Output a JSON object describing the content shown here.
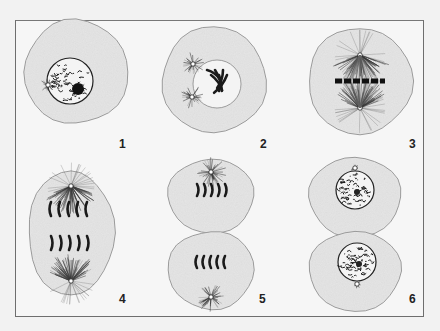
{
  "diagram": {
    "type": "mitosis-stages",
    "colors": {
      "background": "#f2f2f2",
      "frame": "#6e6e6e",
      "cytoplasm": "#e6e6e6",
      "cell_outline": "#9a9a9a",
      "chromatin": "#1a1a1a",
      "nucleus_fill": "#f4f4f4"
    },
    "stages": [
      {
        "label": "1",
        "label_pos": [
          122,
          146
        ],
        "kind": "interphase",
        "cells": [
          {
            "cx": 76,
            "cy": 72,
            "rx": 52,
            "ry": 52
          }
        ],
        "nucleus": {
          "cx": 70,
          "cy": 81,
          "r": 23
        }
      },
      {
        "label": "2",
        "label_pos": [
          258,
          146
        ],
        "kind": "prophase",
        "cells": [
          {
            "cx": 214,
            "cy": 80,
            "rx": 52,
            "ry": 53
          }
        ],
        "nucleus": {
          "cx": 217,
          "cy": 84,
          "r": 24
        }
      },
      {
        "label": "3",
        "label_pos": [
          411,
          146
        ],
        "kind": "metaphase",
        "cells": [
          {
            "cx": 360,
            "cy": 81,
            "rx": 52,
            "ry": 53
          }
        ]
      },
      {
        "label": "4",
        "label_pos": [
          122,
          301
        ],
        "kind": "anaphase",
        "cells": [
          {
            "cx": 71,
            "cy": 233,
            "rx": 43,
            "ry": 62
          }
        ]
      },
      {
        "label": "5",
        "label_pos": [
          262,
          301
        ],
        "kind": "telophase",
        "cells": [
          {
            "cx": 211,
            "cy": 196,
            "rx": 43,
            "ry": 37
          },
          {
            "cx": 211,
            "cy": 270,
            "rx": 43,
            "ry": 39
          }
        ]
      },
      {
        "label": "6",
        "label_pos": [
          411,
          301
        ],
        "kind": "cytokinesis",
        "cells": [
          {
            "cx": 355,
            "cy": 197,
            "rx": 46,
            "ry": 40
          },
          {
            "cx": 355,
            "cy": 271,
            "rx": 46,
            "ry": 40
          }
        ],
        "nuclei": [
          {
            "cx": 355,
            "cy": 190,
            "r": 19
          },
          {
            "cx": 357,
            "cy": 262,
            "r": 19
          }
        ]
      }
    ]
  }
}
